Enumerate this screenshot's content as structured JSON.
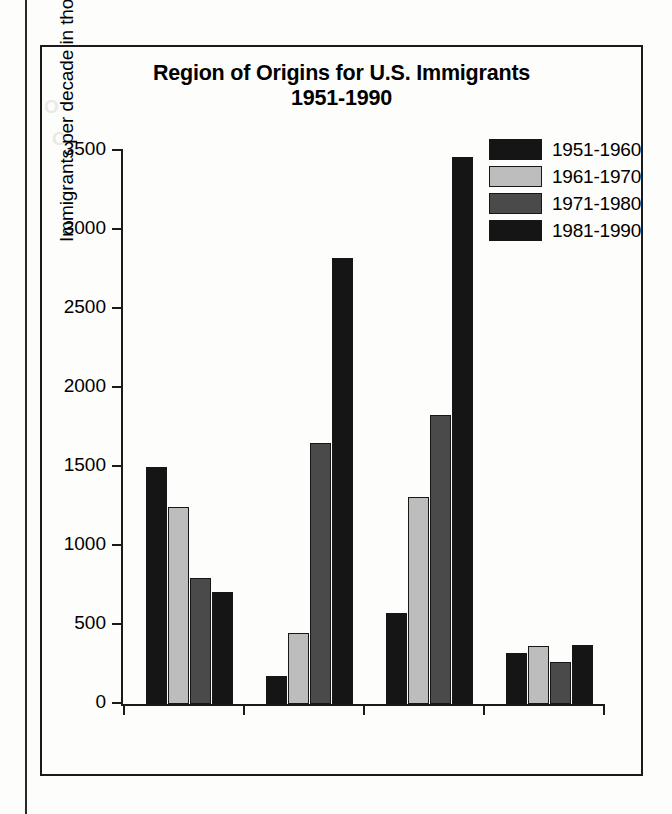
{
  "chart_data": {
    "type": "bar",
    "title": "Region of Origins for U.S. Immigrants",
    "subtitle": "1951-1990",
    "xlabel": "",
    "ylabel": "Immigrants per decade in thousands",
    "ylim": [
      0,
      3500
    ],
    "yticks": [
      0,
      500,
      1000,
      1500,
      2000,
      2500,
      3000,
      3500
    ],
    "ytick_labels": [
      "0",
      "500",
      "1000",
      "1500",
      "2000",
      "2500",
      "3000",
      "3500"
    ],
    "grid": false,
    "legend_position": "top-right",
    "categories": [
      "Europe",
      "Asia",
      "Latin\nAmerica",
      "Africa/\nOther"
    ],
    "category_lines": [
      [
        "Europe"
      ],
      [
        "Asia"
      ],
      [
        "Latin",
        "America"
      ],
      [
        "Africa/",
        "Other"
      ]
    ],
    "series": [
      {
        "name": "1951-1960",
        "color": "#151515",
        "values": [
          1500,
          175,
          575,
          320
        ]
      },
      {
        "name": "1961-1970",
        "color": "#bdbdbd",
        "values": [
          1250,
          450,
          1310,
          365
        ]
      },
      {
        "name": "1971-1980",
        "color": "#4a4a4a",
        "values": [
          800,
          1650,
          1830,
          265
        ]
      },
      {
        "name": "1981-1990",
        "color": "#151515",
        "values": [
          710,
          2820,
          3460,
          375
        ]
      }
    ]
  },
  "ghost_text": {
    "a": "O",
    "b": "O"
  }
}
